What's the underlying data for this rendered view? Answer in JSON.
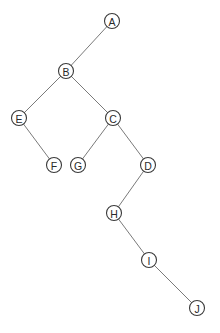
{
  "diagram": {
    "type": "binary-tree",
    "node_radius": 7.5,
    "colors": {
      "background": "#ffffff",
      "edge": "#7a7a7a",
      "node_stroke": "#3a3a3a",
      "label": "#2a2a2a"
    },
    "nodes": [
      {
        "id": "A",
        "label": "A",
        "x": 112,
        "y": 21
      },
      {
        "id": "B",
        "label": "B",
        "x": 66,
        "y": 71
      },
      {
        "id": "E",
        "label": "E",
        "x": 19,
        "y": 118
      },
      {
        "id": "C",
        "label": "C",
        "x": 113,
        "y": 118
      },
      {
        "id": "F",
        "label": "F",
        "x": 54,
        "y": 165
      },
      {
        "id": "G",
        "label": "G",
        "x": 78,
        "y": 165
      },
      {
        "id": "D",
        "label": "D",
        "x": 148,
        "y": 165
      },
      {
        "id": "H",
        "label": "H",
        "x": 114,
        "y": 213
      },
      {
        "id": "I",
        "label": "I",
        "x": 149,
        "y": 260
      },
      {
        "id": "J",
        "label": "J",
        "x": 197,
        "y": 308
      }
    ],
    "edges": [
      {
        "from": "A",
        "to": "B"
      },
      {
        "from": "B",
        "to": "E"
      },
      {
        "from": "B",
        "to": "C"
      },
      {
        "from": "E",
        "to": "F"
      },
      {
        "from": "C",
        "to": "G"
      },
      {
        "from": "C",
        "to": "D"
      },
      {
        "from": "D",
        "to": "H"
      },
      {
        "from": "H",
        "to": "I"
      },
      {
        "from": "I",
        "to": "J"
      }
    ]
  }
}
